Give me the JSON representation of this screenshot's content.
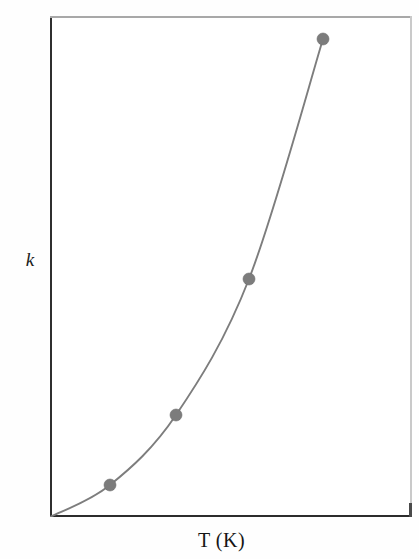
{
  "figure": {
    "kind": "line-plot-with-markers",
    "background_color": "#ffffff"
  },
  "axes": {
    "x_label": "T (K)",
    "y_label": "k",
    "x_label_name": "temperature-kelvin",
    "y_label_name": "rate-constant",
    "frame_color_left": "#2f2f2f",
    "frame_color_bottom": "#2c2c2c",
    "frame_color_top": "#a8a8a8",
    "frame_color_right": "#c9c9c9",
    "ticks_shown": false,
    "tick_labels_shown": false,
    "gridlines": false
  },
  "chart_data": {
    "type": "line",
    "title": "",
    "subtitle": "",
    "xlabel": "T (K)",
    "ylabel": "k",
    "xlim": [
      0,
      1
    ],
    "ylim": [
      0,
      1
    ],
    "grid": false,
    "legend": null,
    "axis_tick_labels_x": [],
    "axis_tick_labels_y": [],
    "annotations": [],
    "series": [
      {
        "name": "rate constant vs temperature",
        "line_color": "#7d7d7d",
        "marker_color": "#7c7c7c",
        "marker_shape": "circle",
        "marker_radius_px": 6,
        "description": "Smooth exponential-like increase of k with T, rising steeply at high T (Arrhenius-type behaviour).",
        "x": [
          0.0,
          0.166,
          0.348,
          0.549,
          0.754
        ],
        "y": [
          0.0,
          0.064,
          0.204,
          0.475,
          0.954
        ],
        "points_px": [
          {
            "x": 50,
            "y": 517,
            "marker": false
          },
          {
            "x": 110,
            "y": 485,
            "marker": true
          },
          {
            "x": 176,
            "y": 415,
            "marker": true
          },
          {
            "x": 249,
            "y": 279,
            "marker": true
          },
          {
            "x": 323,
            "y": 39,
            "marker": true
          }
        ],
        "marker_count": 4
      }
    ]
  }
}
